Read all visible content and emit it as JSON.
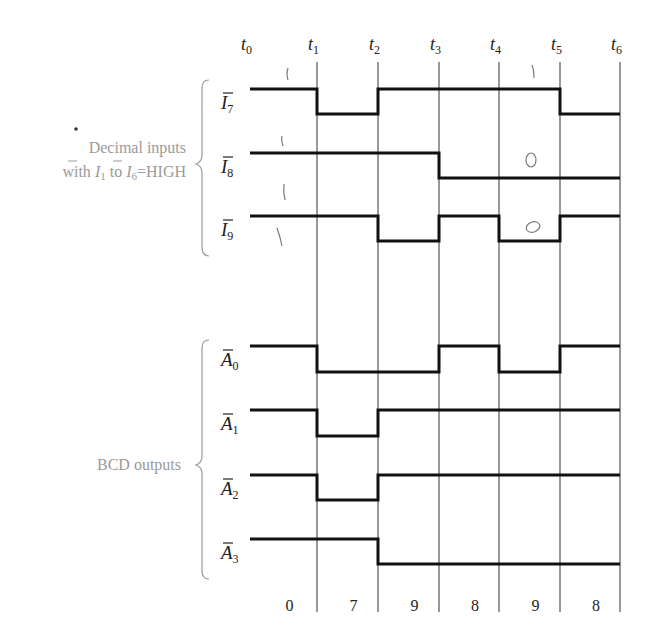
{
  "diagram": {
    "type": "timing-diagram",
    "time_markers": [
      {
        "label": "t",
        "sub": "0",
        "x": 250
      },
      {
        "label": "t",
        "sub": "1",
        "x": 317
      },
      {
        "label": "t",
        "sub": "2",
        "x": 378
      },
      {
        "label": "t",
        "sub": "3",
        "x": 439
      },
      {
        "label": "t",
        "sub": "4",
        "x": 499
      },
      {
        "label": "t",
        "sub": "5",
        "x": 560
      },
      {
        "label": "t",
        "sub": "6",
        "x": 620
      }
    ],
    "groups": [
      {
        "name": "decimal-inputs",
        "label_line1": "Decimal inputs",
        "label_line2_prefix": "with ",
        "label_I1": "I",
        "label_I1_sub": "1",
        "label_to": " to ",
        "label_I6": "I",
        "label_I6_sub": "6",
        "label_suffix": "=HIGH"
      },
      {
        "name": "bcd-outputs",
        "label": "BCD outputs"
      }
    ],
    "signals": [
      {
        "name": "I7",
        "letter": "I",
        "sub": "7",
        "group": "decimal-inputs",
        "levels": [
          1,
          0,
          1,
          1,
          1,
          0
        ],
        "y_high": 89,
        "y_low": 114
      },
      {
        "name": "I8",
        "letter": "I",
        "sub": "8",
        "group": "decimal-inputs",
        "levels": [
          1,
          1,
          1,
          0,
          0,
          0
        ],
        "y_high": 153,
        "y_low": 178
      },
      {
        "name": "I9",
        "letter": "I",
        "sub": "9",
        "group": "decimal-inputs",
        "levels": [
          1,
          1,
          0,
          1,
          0,
          1
        ],
        "y_high": 216,
        "y_low": 241
      },
      {
        "name": "A0",
        "letter": "A",
        "sub": "0",
        "group": "bcd-outputs",
        "levels": [
          1,
          0,
          0,
          1,
          0,
          1
        ],
        "y_high": 346,
        "y_low": 372
      },
      {
        "name": "A1",
        "letter": "A",
        "sub": "1",
        "group": "bcd-outputs",
        "levels": [
          1,
          0,
          1,
          1,
          1,
          1
        ],
        "y_high": 410,
        "y_low": 436
      },
      {
        "name": "A2",
        "letter": "A",
        "sub": "2",
        "group": "bcd-outputs",
        "levels": [
          1,
          0,
          1,
          1,
          1,
          1
        ],
        "y_high": 475,
        "y_low": 500
      },
      {
        "name": "A3",
        "letter": "A",
        "sub": "3",
        "group": "bcd-outputs",
        "levels": [
          1,
          1,
          0,
          0,
          0,
          0
        ],
        "y_high": 539,
        "y_low": 564
      }
    ],
    "interval_values": [
      "0",
      "7",
      "9",
      "8",
      "9",
      "8"
    ],
    "handwritten_annotations": [
      "1",
      "1",
      "1",
      "1",
      "1",
      "0",
      "0"
    ]
  }
}
